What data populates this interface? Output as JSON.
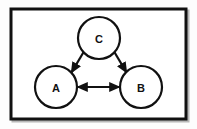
{
  "figure": {
    "type": "node-link-diagram",
    "background_color": "#fdfdfd",
    "frame": {
      "name": "outer-frame",
      "stroke_color": "#111111",
      "fill_color": "#ffffff",
      "stroke_width": 3,
      "x": 11,
      "y": 9,
      "width": 175,
      "height": 110,
      "shadow_color": "#b8b8b8",
      "shadow_offset": 2
    },
    "nodes": [
      {
        "id": "C",
        "label": "C",
        "name": "node-c",
        "cx": 99,
        "cy": 38,
        "r": 21,
        "stroke_color": "#111111",
        "fill_color": "#ffffff",
        "stroke_width": 2.2
      },
      {
        "id": "A",
        "label": "A",
        "name": "node-a",
        "cx": 56,
        "cy": 87,
        "r": 21,
        "stroke_color": "#111111",
        "fill_color": "#ffffff",
        "stroke_width": 2.2
      },
      {
        "id": "B",
        "label": "B",
        "name": "node-b",
        "cx": 141,
        "cy": 87,
        "r": 21,
        "stroke_color": "#111111",
        "fill_color": "#ffffff",
        "stroke_width": 2.2
      }
    ],
    "edges": [
      {
        "id": "C-A",
        "name": "edge-c-to-a",
        "from": "C",
        "to": "A",
        "direction": "forward",
        "x1": 83.5,
        "y1": 52.2,
        "x2": 71.4,
        "y2": 72.6,
        "stroke_color": "#111111",
        "stroke_width": 2.2
      },
      {
        "id": "C-B",
        "name": "edge-c-to-b",
        "from": "C",
        "to": "B",
        "direction": "forward",
        "x1": 114.5,
        "y1": 52.2,
        "x2": 126.6,
        "y2": 72.6,
        "stroke_color": "#111111",
        "stroke_width": 2.2
      },
      {
        "id": "A-B",
        "name": "edge-a-to-b-bidirectional",
        "from": "A",
        "to": "B",
        "direction": "both",
        "x1": 77.5,
        "y1": 87,
        "x2": 119.5,
        "y2": 87,
        "stroke_color": "#111111",
        "stroke_width": 2.2
      }
    ]
  }
}
